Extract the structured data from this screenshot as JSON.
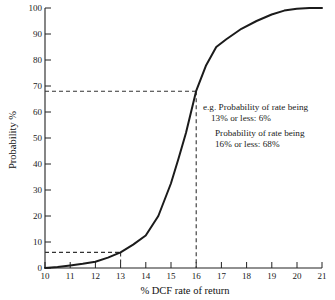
{
  "chart_data": {
    "type": "line",
    "title": "",
    "xlabel": "% DCF rate of return",
    "ylabel": "Probability %",
    "xlim": [
      10,
      21
    ],
    "ylim": [
      0,
      100
    ],
    "grid": false,
    "legend": "none",
    "xticks": [
      "10",
      "11",
      "12",
      "13",
      "14",
      "15",
      "16",
      "17",
      "18",
      "19",
      "20",
      "21"
    ],
    "yticks": [
      "0",
      "10",
      "20",
      "30",
      "40",
      "50",
      "60",
      "70",
      "80",
      "90",
      "100"
    ],
    "series": [
      {
        "name": "Cumulative probability of DCF rate",
        "x": [
          10.0,
          10.5,
          11.0,
          11.5,
          12.0,
          12.5,
          13.0,
          13.5,
          14.0,
          14.5,
          15.0,
          15.3,
          15.6,
          16.0,
          16.4,
          16.8,
          17.2,
          17.8,
          18.4,
          19.0,
          19.5,
          20.0,
          20.5,
          21.0
        ],
        "y": [
          0.0,
          0.4,
          1.0,
          1.6,
          2.4,
          4.0,
          6.0,
          9.0,
          12.5,
          20.0,
          32.5,
          42.0,
          52.0,
          68.0,
          78.0,
          85.0,
          88.0,
          92.0,
          95.0,
          97.5,
          99.0,
          99.7,
          100.0,
          100.0
        ]
      }
    ],
    "reference_lines": [
      {
        "name": "p13",
        "x": 13,
        "y": 6,
        "note": "Probability of rate being 13% or less: 6%"
      },
      {
        "name": "p16",
        "x": 16,
        "y": 68,
        "note": "Probability of rate being 16% or less: 68%"
      }
    ],
    "annotations": [
      {
        "line1": "e.g. Probability of rate being",
        "line2": "13% or less: 6%"
      },
      {
        "line1": "Probability of rate being",
        "line2": "16% or less: 68%"
      }
    ],
    "colors": {
      "curve": "#1b1b1b",
      "axis": "#222222",
      "dash": "#333333",
      "background": "#ffffff"
    }
  }
}
